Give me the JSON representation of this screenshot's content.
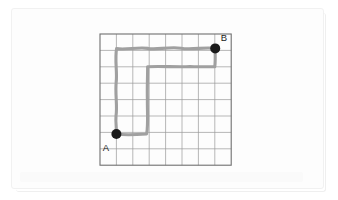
{
  "figure": {
    "background_color": "#ffffff",
    "frame_color": "#f1f1f1",
    "grid": {
      "columns": 8,
      "rows": 8,
      "cell_size_px": 16.4,
      "origin_x_px": 100,
      "origin_y_px": 34,
      "line_color": "#9a9a9a",
      "border_color": "#6f6f6f"
    },
    "path": {
      "stroke_color": "#a0a0a0",
      "stroke_width_px": 3.1,
      "description": "Hand-drawn route from A to B following grid lines",
      "waypoints_px": [
        [
          116,
          134
        ],
        [
          147,
          134
        ],
        [
          147,
          100
        ],
        [
          147,
          67
        ],
        [
          182,
          67
        ],
        [
          215,
          67
        ],
        [
          215,
          48
        ],
        [
          182,
          48
        ],
        [
          149,
          48
        ],
        [
          116,
          48
        ],
        [
          116,
          90
        ],
        [
          116,
          134
        ]
      ],
      "segments": [
        "A right along bottom to column 3",
        "up column 3 to row 2",
        "right along row 2 to column 7",
        "up column 7 to B",
        "left along top row back to column 1",
        "down column 1 back to A"
      ]
    },
    "nodes": [
      {
        "id": "A",
        "label": "A",
        "x_px": 116,
        "y_px": 134,
        "label_x_px": 107,
        "label_y_px": 149,
        "dot_color": "#1a1a1a",
        "radius_px": 5.0
      },
      {
        "id": "B",
        "label": "B",
        "x_px": 215,
        "y_px": 48,
        "label_x_px": 221,
        "label_y_px": 40,
        "dot_color": "#1a1a1a",
        "radius_px": 5.0
      }
    ]
  }
}
